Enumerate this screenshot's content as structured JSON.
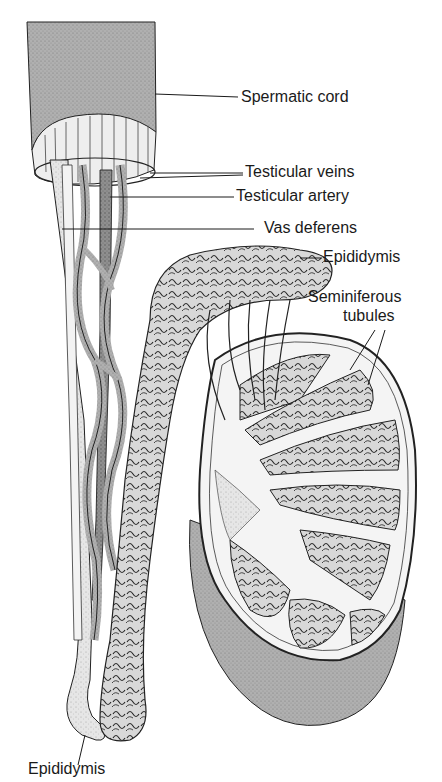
{
  "figure": {
    "colors": {
      "ink": "#1a1a1a",
      "cord": "#a9a9a9",
      "vein": "#8c8c8c",
      "artery": "#6e6e6e",
      "light": "#e2e2e2",
      "tubule": "#cfcfcf",
      "testis": "#9a9a9a"
    }
  },
  "labels": {
    "spermatic_cord": "Spermatic cord",
    "testicular_veins": "Testicular veins",
    "testicular_artery": "Testicular artery",
    "vas_deferens": "Vas deferens",
    "epididymis_top": "Epididymis",
    "seminiferous_line1": "Seminiferous",
    "seminiferous_line2": "tubules",
    "epididymis_bottom": "Epididymis"
  }
}
